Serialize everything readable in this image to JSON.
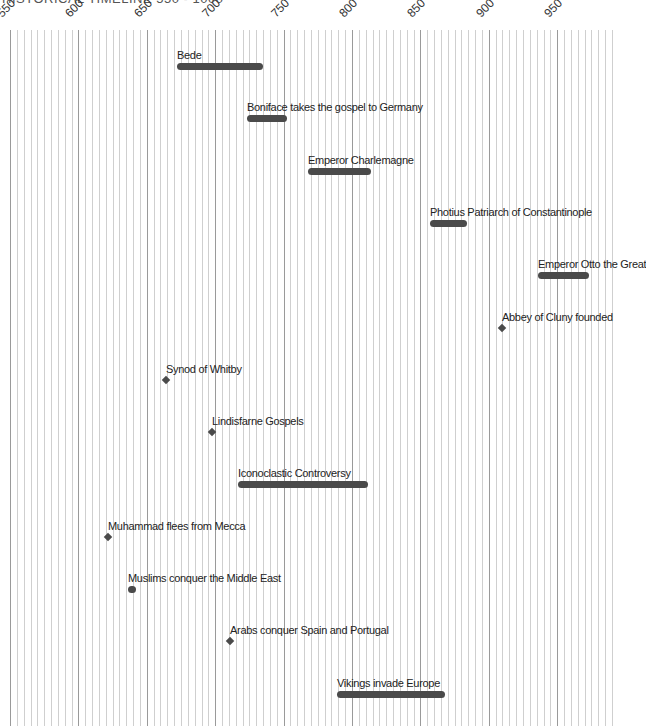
{
  "chart_data": {
    "type": "timeline",
    "title": "HISTORICAL TIMELINE 550 - 1000",
    "xlabel": "Year",
    "ylabel": "",
    "xlim": [
      550,
      990
    ],
    "major_ticks": [
      550,
      600,
      650,
      700,
      750,
      800,
      850,
      900,
      950
    ],
    "minor_tick_interval": 5,
    "grid": true,
    "legend": null,
    "events": [
      {
        "label": "Bede",
        "start": 672,
        "end": 735,
        "kind": "span"
      },
      {
        "label": "Boniface takes the gospel to Germany",
        "start": 723,
        "end": 752,
        "kind": "span"
      },
      {
        "label": "Emperor Charlemagne",
        "start": 768,
        "end": 814,
        "kind": "span"
      },
      {
        "label": "Photius Patriarch of Constantinople",
        "start": 857,
        "end": 884,
        "kind": "span"
      },
      {
        "label": "Emperor Otto the Great",
        "start": 936,
        "end": 973,
        "kind": "span"
      },
      {
        "label": "Abbey of Cluny founded",
        "start": 910,
        "end": 910,
        "kind": "point"
      },
      {
        "label": "Synod of Whitby",
        "start": 664,
        "end": 664,
        "kind": "point"
      },
      {
        "label": "Lindisfarne Gospels",
        "start": 698,
        "end": 698,
        "kind": "point"
      },
      {
        "label": "Iconoclastic Controversy",
        "start": 717,
        "end": 812,
        "kind": "span"
      },
      {
        "label": "Muhammad flees from Mecca",
        "start": 622,
        "end": 622,
        "kind": "point"
      },
      {
        "label": "Muslims conquer the Middle East",
        "start": 636,
        "end": 642,
        "kind": "span"
      },
      {
        "label": "Arabs conquer Spain and Portugal",
        "start": 711,
        "end": 711,
        "kind": "point"
      },
      {
        "label": "Vikings invade Europe",
        "start": 789,
        "end": 868,
        "kind": "span"
      }
    ]
  },
  "colors": {
    "bar": "#4a4a4a",
    "grid_minor": "#cfcfcf",
    "grid_major": "#9a9a9a",
    "text": "#222222"
  }
}
